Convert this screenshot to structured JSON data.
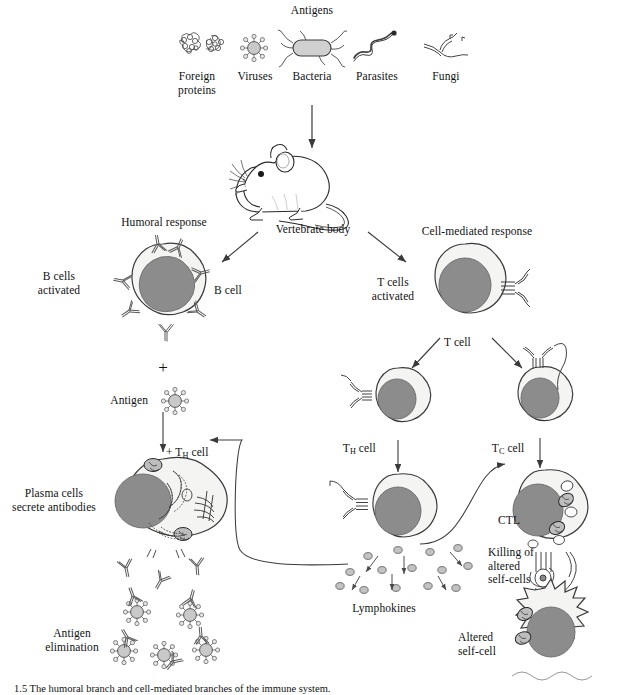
{
  "figure": {
    "title": "Antigens",
    "caption": "1.5   The humoral branch and cell-mediated branches of the immune system."
  },
  "antigen_types": [
    {
      "name": "Foreign\nproteins",
      "icon": "foreign-proteins-icon"
    },
    {
      "name": "Viruses",
      "icon": "virus-icon"
    },
    {
      "name": "Bacteria",
      "icon": "bacteria-icon"
    },
    {
      "name": "Parasites",
      "icon": "parasite-icon"
    },
    {
      "name": "Fungi",
      "icon": "fungi-icon"
    }
  ],
  "body": {
    "label": "Vertebrate body",
    "icon": "mouse-icon"
  },
  "branches": {
    "humoral": "Humoral response",
    "cell_mediated": "Cell-mediated response"
  },
  "humoral": {
    "b_cells_activated": "B cells\nactivated",
    "b_cell": "B cell",
    "plus": "+",
    "antigen": "Antigen",
    "plus_th_cell_pre": "+ T",
    "plus_th_cell_sub": "H",
    "plus_th_cell_post": " cell",
    "plasma_cells": "Plasma cells\nsecrete antibodies",
    "antigen_elimination": "Antigen\nelimination"
  },
  "cell_mediated": {
    "t_cells_activated": "T cells\nactivated",
    "t_cell": "T cell",
    "th_cell_pre": "T",
    "th_cell_sub": "H",
    "th_cell_post": " cell",
    "tc_cell_pre": "T",
    "tc_cell_sub": "C",
    "tc_cell_post": " cell",
    "lymphokines": "Lymphokines",
    "ctl": "CTL",
    "killing": "Killing of\naltered\nself-cells",
    "altered_self_cell": "Altered\nself-cell"
  },
  "colors": {
    "nucleus": "#8c8c8c",
    "cytoplasm": "#f4f4f2",
    "stroke": "#3a3a3a",
    "antigen_fill": "#c9c9c9",
    "lymphokine_fill": "#c2c2c2",
    "text": "#111111",
    "background": "#ffffff"
  }
}
